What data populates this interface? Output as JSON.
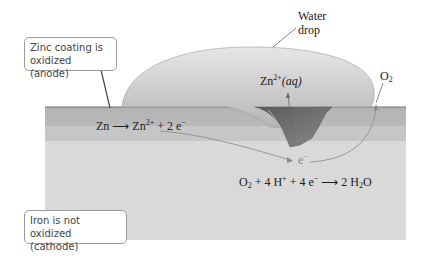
{
  "figure": {
    "colors": {
      "background": "#ffffff",
      "zinc_layer": "#b9b9b9",
      "zinc_layer_lower": "#c4c4c4",
      "iron_layer": "#d8d8d8",
      "water_drop": "#cdcdcd",
      "pit_dark": "#6e6e6e",
      "arrow": "#666666",
      "callout_border": "#9a9a9a"
    }
  },
  "callouts": {
    "anode": {
      "line1": "Zinc coating is",
      "line2": "oxidized (anode)"
    },
    "cathode": {
      "line1": "Iron is not oxidized",
      "line2": "(cathode)"
    }
  },
  "labels": {
    "water_drop": {
      "line1": "Water",
      "line2": "drop"
    },
    "zn_aq": {
      "base": "Zn",
      "charge": "2+",
      "state": "(aq)"
    },
    "o2": {
      "base": "O",
      "sub": "2"
    },
    "electron": {
      "base": "e",
      "charge": "−"
    }
  },
  "equations": {
    "anode_half": {
      "lhs": "Zn",
      "arrow": "⟶",
      "rhs_base": "Zn",
      "rhs_charge": "2+",
      "rhs_rest": " + 2 e",
      "rhs_rest_charge": "−"
    },
    "cathode_half": {
      "o": "O",
      "o_sub": "2",
      "plus1": " + 4 H",
      "h_charge": "+",
      "plus2": " + 4 e",
      "e_charge": "−",
      "arrow": "⟶",
      "rhs_pre": " 2 H",
      "rhs_sub": "2",
      "rhs_post": "O"
    }
  }
}
